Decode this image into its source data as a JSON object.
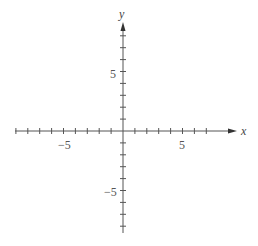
{
  "chart_data": {
    "type": "line",
    "title": "",
    "xlabel": "x",
    "ylabel": "y",
    "xlim": [
      -9,
      7
    ],
    "ylim": [
      -8,
      8
    ],
    "x_tick_step": 1,
    "y_tick_step": 1,
    "x_tick_labels": [
      {
        "value": -5,
        "text": "−5"
      },
      {
        "value": 5,
        "text": "5"
      }
    ],
    "y_tick_labels": [
      {
        "value": 5,
        "text": "5"
      },
      {
        "value": -5,
        "text": "−5"
      }
    ],
    "grid": false,
    "series": []
  },
  "axes": {
    "x_label": "x",
    "y_label": "y",
    "x_neg5": "−5",
    "x_pos5": "5",
    "y_pos5": "5",
    "y_neg5": "−5",
    "color": "#555555"
  }
}
